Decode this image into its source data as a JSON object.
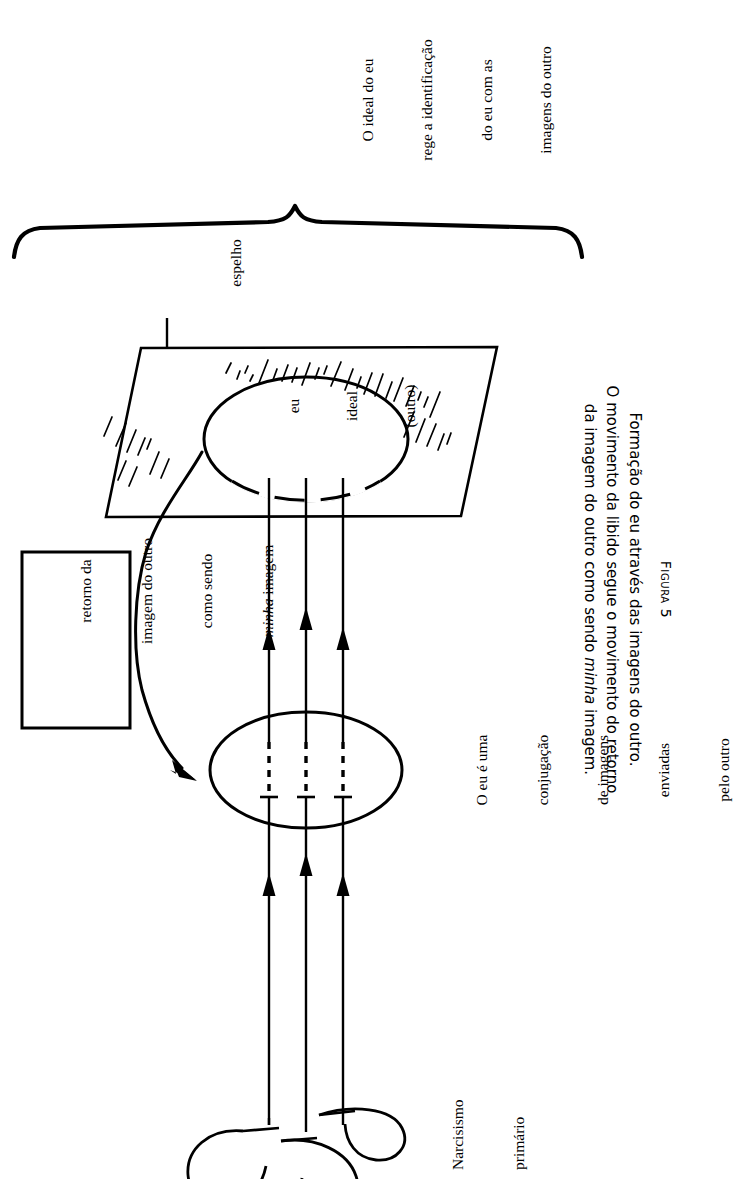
{
  "figure": {
    "id": "figura-5",
    "title": "Figura 5",
    "caption_lines": [
      "Formação do eu através das imagens do outro.",
      "O movimento da libido segue o movimento do retorno",
      "da imagem do outro como sendo "
    ],
    "caption_italic_word": "minha",
    "caption_tail": " imagem."
  },
  "brace": {
    "label_lines": [
      "O ideal do eu",
      "rege a identificação",
      "do eu com as",
      "imagens do outro"
    ]
  },
  "mirror": {
    "pointer_label": "espelho",
    "ellipse_lines": [
      "eu",
      "ideal",
      "(outro)"
    ]
  },
  "callout_box": {
    "lines": [
      "retorno da",
      "imagem do outro",
      "como sendo"
    ],
    "italic_word": "minha",
    "tail": " imagem"
  },
  "self_ellipse": {
    "label_lines": [
      "O eu é uma",
      "conjugação",
      "de imagens",
      "enviadas",
      "pelo outro"
    ]
  },
  "narcissism": {
    "label_lines": [
      "Narcisismo",
      "primário"
    ]
  },
  "colors": {
    "ink": "#000000",
    "paper": "#ffffff"
  }
}
